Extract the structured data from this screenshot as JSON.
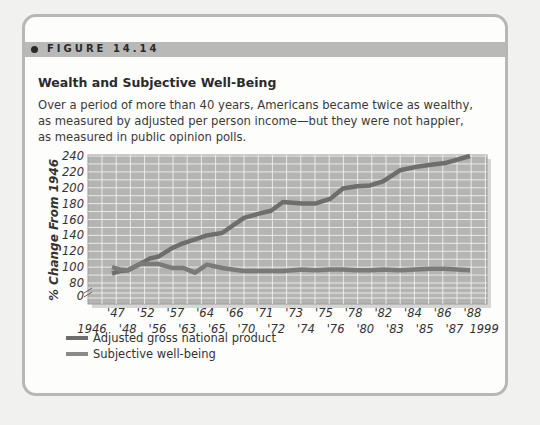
{
  "figure": {
    "label": "FIGURE 14.14",
    "title": "Wealth and Subjective Well-Being",
    "caption": "Over a period of more than 40 years, Americans became twice as wealthy, as measured by adjusted per person income—but they were not happier, as measured in public opinion polls."
  },
  "colors": {
    "card_border": "#b7b7b5",
    "strip": "#b9b9b7",
    "plot_bg": "#b4b4b2",
    "grid": "#f4f4f2",
    "gnp_line": "#6e6e6c",
    "swb_line": "#7a7a78"
  },
  "legend": {
    "items": [
      {
        "label": "Adjusted gross national product",
        "color": "#6e6e6c"
      },
      {
        "label": "Subjective well-being",
        "color": "#8a8a88"
      }
    ]
  },
  "chart_data": {
    "type": "line",
    "title": "Wealth and Subjective Well-Being",
    "xlabel": "",
    "ylabel": "% Change From 1946",
    "ylim": [
      0,
      240
    ],
    "y_ticks": [
      "240",
      "220",
      "200",
      "180",
      "160",
      "140",
      "120",
      "100",
      "80",
      "0"
    ],
    "axis_break": "between 0 and 80",
    "x_tick_labels_top": [
      "'47",
      "'52",
      "'57",
      "'64",
      "'66",
      "'71",
      "'73",
      "'75",
      "'78",
      "'82",
      "'84",
      "'86",
      "'88"
    ],
    "x_tick_labels_bottom": [
      "1946",
      "'48",
      "'56",
      "'63",
      "'65",
      "'70",
      "'72",
      "'74",
      "'76",
      "'80",
      "'83",
      "'85",
      "'87",
      "1999"
    ],
    "x": [
      "1946",
      "1947",
      "1948",
      "1952",
      "1956",
      "1957",
      "1963",
      "1964",
      "1965",
      "1966",
      "1970",
      "1971",
      "1972",
      "1973",
      "1974",
      "1975",
      "1976",
      "1978",
      "1980",
      "1982",
      "1983",
      "1984",
      "1985",
      "1986",
      "1987",
      "1988",
      "1999"
    ],
    "series": [
      {
        "name": "Adjusted gross national product",
        "values": [
          92,
          95,
          96,
          104,
          111,
          113,
          124,
          130,
          135,
          140,
          143,
          162,
          167,
          171,
          182,
          180,
          180,
          186,
          199,
          202,
          203,
          208,
          222,
          226,
          229,
          231,
          240
        ]
      },
      {
        "name": "Subjective well-being",
        "values": [
          100,
          97,
          96,
          104,
          104,
          104,
          99,
          99,
          93,
          103,
          99,
          95,
          95,
          95,
          95,
          97,
          96,
          97,
          97,
          96,
          96,
          97,
          96,
          97,
          98,
          98,
          96
        ]
      }
    ],
    "grid": true,
    "legend_position": "bottom-left"
  }
}
